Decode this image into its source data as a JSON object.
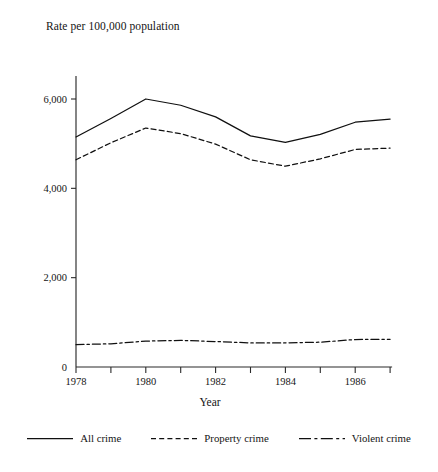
{
  "chart_data": {
    "type": "line",
    "title": "Rate per 100,000 population",
    "xlabel": "Year",
    "ylabel": "",
    "x": [
      1978,
      1979,
      1980,
      1981,
      1982,
      1983,
      1984,
      1985,
      1986,
      1987
    ],
    "xtick_labels": [
      "1978",
      "",
      "1980",
      "",
      "1982",
      "",
      "1984",
      "",
      "1986",
      ""
    ],
    "ytick_values": [
      0,
      2000,
      4000,
      6000
    ],
    "ytick_labels": [
      "0",
      "2,000",
      "4,000",
      "6,000"
    ],
    "xlim": [
      1978,
      1987
    ],
    "ylim": [
      0,
      7000
    ],
    "grid": false,
    "legend_position": "bottom",
    "series": [
      {
        "name": "All crime",
        "style": "solid",
        "values": [
          5150,
          5565,
          6000,
          5860,
          5600,
          5175,
          5030,
          5210,
          5480,
          5550
        ]
      },
      {
        "name": "Property crime",
        "style": "dashed",
        "values": [
          4640,
          5020,
          5350,
          5225,
          4990,
          4640,
          4495,
          4660,
          4870,
          4900
        ]
      },
      {
        "name": "Violent crime",
        "style": "dash-dot",
        "values": [
          500,
          520,
          580,
          595,
          570,
          540,
          540,
          555,
          615,
          620
        ]
      }
    ]
  },
  "legend": {
    "items": [
      {
        "label": "All crime",
        "style": "solid"
      },
      {
        "label": "Property crime",
        "style": "dashed"
      },
      {
        "label": "Violent crime",
        "style": "dash-dot"
      }
    ]
  }
}
